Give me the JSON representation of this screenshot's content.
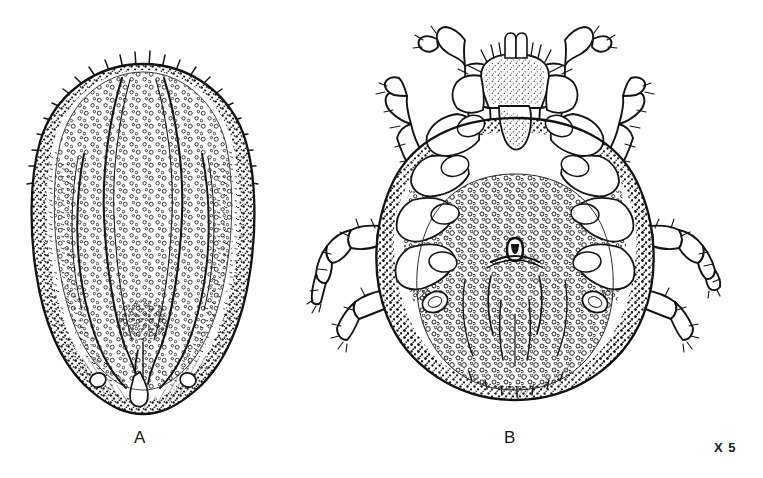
{
  "plate": {
    "background_color": "#ffffff",
    "ink_color": "#151515",
    "panels": [
      {
        "id": "A",
        "label": "A",
        "view": "dorsal",
        "subject": "ixodid tick female dorsum",
        "features": [
          "marginal setae",
          "punctate scutum",
          "cervical grooves",
          "lateral grooves",
          "posteromedian groove",
          "festoons"
        ]
      },
      {
        "id": "B",
        "label": "B",
        "view": "ventral",
        "subject": "ixodid tick female venter with legs",
        "features": [
          "capitulum",
          "palps",
          "hypostome",
          "coxae I-IV",
          "genital aperture",
          "spiracular plates",
          "four pairs of legs",
          "tarsal claws"
        ]
      }
    ],
    "magnification": "X 5"
  }
}
